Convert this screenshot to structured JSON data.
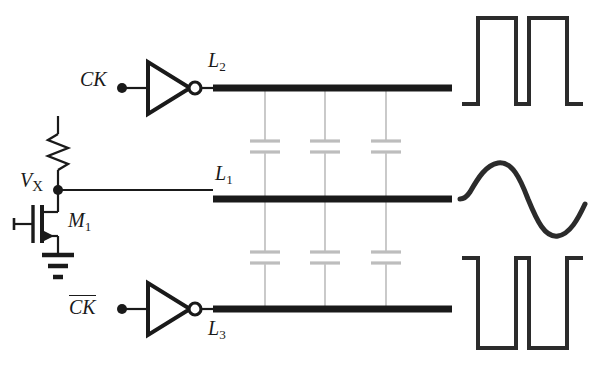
{
  "figure": {
    "background_color": "#ffffff",
    "line_color": "#1a1a1a",
    "cap_color": "#b9b9b9",
    "stub_color": "#c4c4c4"
  },
  "labels": {
    "ck": "CK",
    "ck_bar": "CK",
    "ck_bar_has_overline": true,
    "vx_main": "V",
    "vx_sub": "X",
    "m1_main": "M",
    "m1_sub": "1",
    "l1_main": "L",
    "l1_sub": "1",
    "l2_main": "L",
    "l2_sub": "2",
    "l3_main": "L",
    "l3_sub": "3"
  },
  "components": {
    "resistor": {
      "name": "pull-up-resistor",
      "x": 58,
      "y_top": 118,
      "y_bottom": 186,
      "zigzag_peaks": 4
    },
    "transistor": {
      "name": "nmos-transistor-m1",
      "type": "nmos",
      "gate_x": 16,
      "channel_x": 40,
      "drain_node_y": 190,
      "source_y": 252
    },
    "ground": {
      "name": "ground-symbol",
      "x": 52,
      "y": 252,
      "bars": 3
    },
    "node_vx": {
      "name": "node-vx",
      "x": 58,
      "y": 190
    },
    "inverter_top": {
      "name": "inverter-top",
      "input_x": 122,
      "output_x": 200,
      "y": 88
    },
    "inverter_bottom": {
      "name": "inverter-bottom",
      "input_x": 122,
      "output_x": 200,
      "y": 309
    },
    "lines": [
      {
        "name": "transmission-line-l2",
        "id": "L2",
        "y": 88,
        "x_start": 213,
        "x_end": 452,
        "thickness": 7
      },
      {
        "name": "transmission-line-l1",
        "id": "L1",
        "y": 199,
        "x_start": 213,
        "x_end": 452,
        "thickness": 7
      },
      {
        "name": "transmission-line-l3",
        "id": "L3",
        "y": 309,
        "x_start": 213,
        "x_end": 452,
        "thickness": 7
      }
    ],
    "coupling_branches": [
      {
        "name": "coupling-branch-1",
        "x": 265
      },
      {
        "name": "coupling-branch-2",
        "x": 325
      },
      {
        "name": "coupling-branch-3",
        "x": 386
      }
    ],
    "capacitor_rows": [
      {
        "name": "capacitor-row-upper",
        "between": "L2-L1",
        "y_center": 147
      },
      {
        "name": "capacitor-row-lower",
        "between": "L1-L3",
        "y_center": 258
      }
    ]
  },
  "waveforms": {
    "top": {
      "name": "waveform-square-top",
      "type": "square",
      "start_level": "low",
      "pulses": 2,
      "x_start": 462,
      "x_end": 583,
      "y_high": 18,
      "y_low": 104
    },
    "middle": {
      "name": "waveform-sine-middle",
      "type": "sine",
      "cycles": 1,
      "x_start": 460,
      "x_end": 585,
      "y_center": 199,
      "amplitude": 37
    },
    "bottom": {
      "name": "waveform-square-bottom",
      "type": "square",
      "start_level": "high",
      "pulses": 2,
      "x_start": 462,
      "x_end": 583,
      "y_high": 258,
      "y_low": 348
    }
  }
}
